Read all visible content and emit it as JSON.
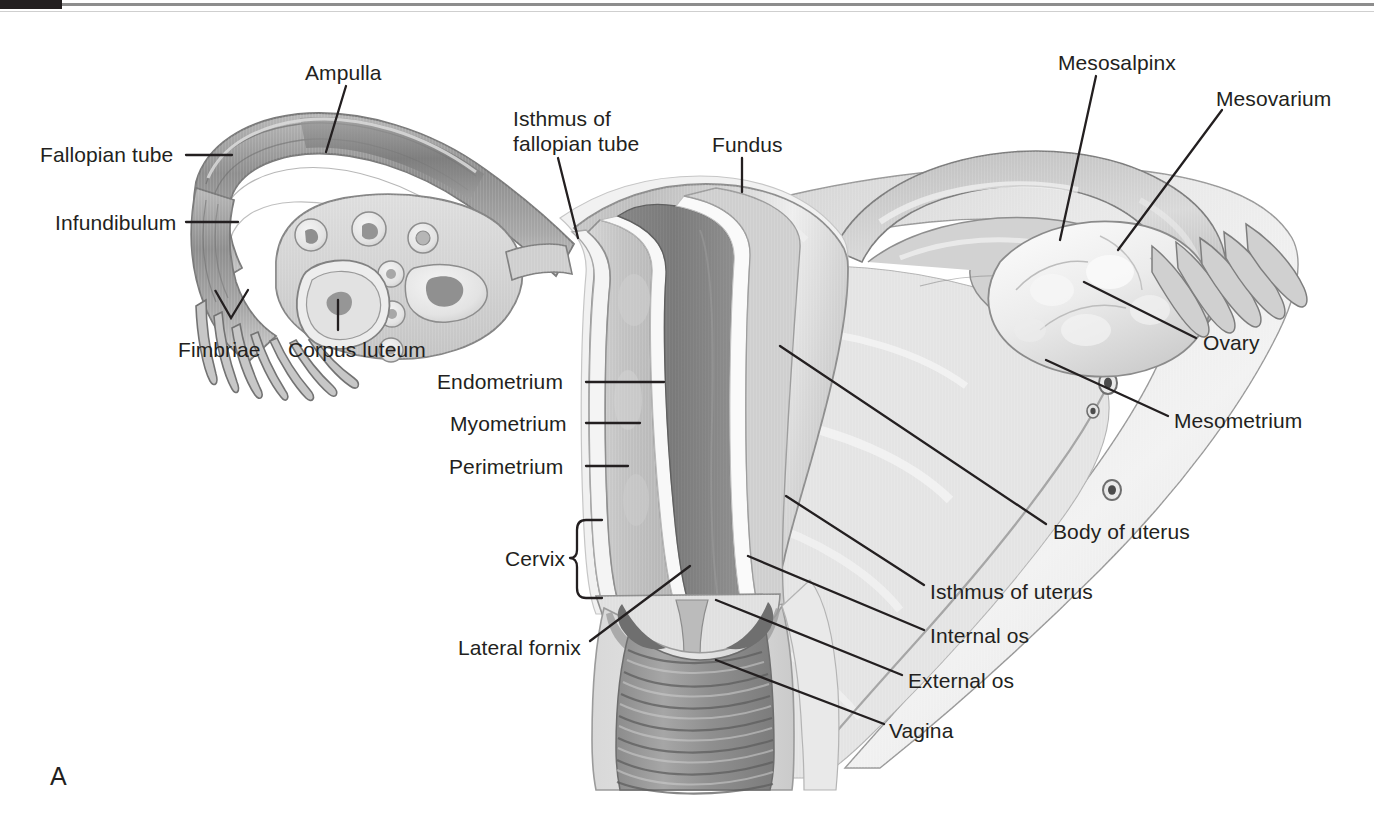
{
  "figure": {
    "panel_letter": "A",
    "background_color": "#ffffff",
    "line_color": "#231f20"
  },
  "labels": [
    {
      "id": "ampulla",
      "text": "Ampulla",
      "x": 305,
      "y": 60,
      "align": "left"
    },
    {
      "id": "fallopian_tube",
      "text": "Fallopian tube",
      "x": 40,
      "y": 142,
      "align": "left"
    },
    {
      "id": "infundibulum",
      "text": "Infundibulum",
      "x": 55,
      "y": 210,
      "align": "left"
    },
    {
      "id": "fimbriae",
      "text": "Fimbriae",
      "x": 178,
      "y": 337,
      "align": "left"
    },
    {
      "id": "corpus_luteum",
      "text": "Corpus luteum",
      "x": 288,
      "y": 337,
      "align": "left"
    },
    {
      "id": "isthmus_fallopian",
      "text": "Isthmus of",
      "text2": "fallopian tube",
      "x": 513,
      "y": 106,
      "align": "left"
    },
    {
      "id": "fundus",
      "text": "Fundus",
      "x": 712,
      "y": 132,
      "align": "left"
    },
    {
      "id": "mesosalpinx",
      "text": "Mesosalpinx",
      "x": 1058,
      "y": 50,
      "align": "left"
    },
    {
      "id": "mesovarium",
      "text": "Mesovarium",
      "x": 1216,
      "y": 86,
      "align": "left"
    },
    {
      "id": "ovary",
      "text": "Ovary",
      "x": 1203,
      "y": 330,
      "align": "left"
    },
    {
      "id": "mesometrium",
      "text": "Mesometrium",
      "x": 1174,
      "y": 408,
      "align": "left"
    },
    {
      "id": "endometrium",
      "text": "Endometrium",
      "x": 437,
      "y": 369,
      "align": "left"
    },
    {
      "id": "myometrium",
      "text": "Myometrium",
      "x": 450,
      "y": 411,
      "align": "left"
    },
    {
      "id": "perimetrium",
      "text": "Perimetrium",
      "x": 449,
      "y": 454,
      "align": "left"
    },
    {
      "id": "cervix",
      "text": "Cervix",
      "x": 505,
      "y": 546,
      "align": "left"
    },
    {
      "id": "lateral_fornix",
      "text": "Lateral fornix",
      "x": 458,
      "y": 635,
      "align": "left"
    },
    {
      "id": "body_of_uterus",
      "text": "Body of uterus",
      "x": 1053,
      "y": 519,
      "align": "left"
    },
    {
      "id": "isthmus_of_uterus",
      "text": "Isthmus of uterus",
      "x": 930,
      "y": 579,
      "align": "left"
    },
    {
      "id": "internal_os",
      "text": "Internal os",
      "x": 930,
      "y": 623,
      "align": "left"
    },
    {
      "id": "external_os",
      "text": "External os",
      "x": 908,
      "y": 668,
      "align": "left"
    },
    {
      "id": "vagina",
      "text": "Vagina",
      "x": 889,
      "y": 718,
      "align": "left"
    }
  ],
  "structures": [
    {
      "id": "fallopian-tube-left",
      "name": "Fallopian tube (left)"
    },
    {
      "id": "infundibulum-left",
      "name": "Infundibulum (left)"
    },
    {
      "id": "fimbriae-left",
      "name": "Fimbriae (left)"
    },
    {
      "id": "ovary-left-sectioned",
      "name": "Ovary, sectioned, with follicles and corpus luteum"
    },
    {
      "id": "corpus-luteum",
      "name": "Corpus luteum"
    },
    {
      "id": "uterus-body",
      "name": "Body of uterus, coronal section"
    },
    {
      "id": "endometrium",
      "name": "Endometrium"
    },
    {
      "id": "myometrium",
      "name": "Myometrium"
    },
    {
      "id": "perimetrium",
      "name": "Perimetrium"
    },
    {
      "id": "uterine-cavity",
      "name": "Uterine cavity"
    },
    {
      "id": "cervix",
      "name": "Cervix"
    },
    {
      "id": "vagina-rugae",
      "name": "Vagina with rugae"
    },
    {
      "id": "broad-ligament",
      "name": "Broad ligament / mesometrium"
    },
    {
      "id": "mesosalpinx",
      "name": "Mesosalpinx"
    },
    {
      "id": "mesovarium",
      "name": "Mesovarium"
    },
    {
      "id": "ovary-right",
      "name": "Ovary (right), surface view"
    },
    {
      "id": "fimbriae-right",
      "name": "Fimbriae (right)"
    },
    {
      "id": "uterine-vessels",
      "name": "Uterine vessels in broad ligament"
    }
  ]
}
